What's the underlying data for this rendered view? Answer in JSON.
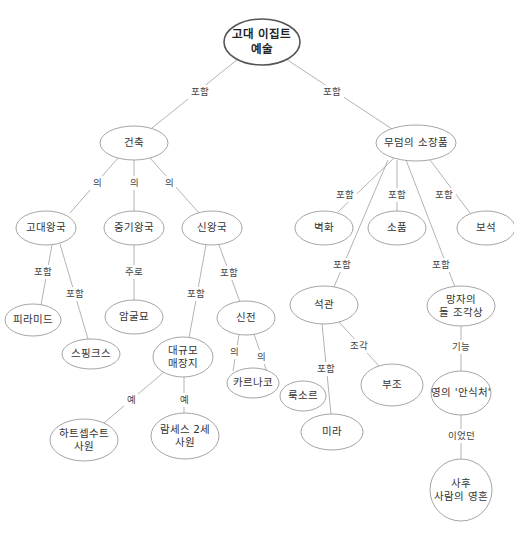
{
  "diagram": {
    "colors": {
      "node_stroke": "#9a9a9a",
      "root_stroke": "#555555",
      "edge": "#aaaaaa",
      "text": "#333333"
    },
    "nodes": [
      {
        "id": "root",
        "lines": [
          "고대 이집트",
          "예술"
        ],
        "x": 262,
        "y": 42,
        "rx": 38,
        "ry": 23,
        "root": true
      },
      {
        "id": "architecture",
        "lines": [
          "건축"
        ],
        "x": 134,
        "y": 143,
        "rx": 34,
        "ry": 17
      },
      {
        "id": "tomb-contents",
        "lines": [
          "무덤의 소장품"
        ],
        "x": 416,
        "y": 143,
        "rx": 40,
        "ry": 18
      },
      {
        "id": "old-kingdom",
        "lines": [
          "고대왕국"
        ],
        "x": 46,
        "y": 228,
        "rx": 30,
        "ry": 17
      },
      {
        "id": "middle-kingdom",
        "lines": [
          "중기왕국"
        ],
        "x": 134,
        "y": 228,
        "rx": 30,
        "ry": 17
      },
      {
        "id": "new-kingdom",
        "lines": [
          "신왕국"
        ],
        "x": 212,
        "y": 228,
        "rx": 30,
        "ry": 17
      },
      {
        "id": "mural",
        "lines": [
          "벽화"
        ],
        "x": 324,
        "y": 228,
        "rx": 29,
        "ry": 17
      },
      {
        "id": "accessories",
        "lines": [
          "소품"
        ],
        "x": 397,
        "y": 228,
        "rx": 29,
        "ry": 17
      },
      {
        "id": "jewelry",
        "lines": [
          "보석"
        ],
        "x": 486,
        "y": 228,
        "rx": 29,
        "ry": 17
      },
      {
        "id": "pyramid",
        "lines": [
          "피라미드"
        ],
        "x": 33,
        "y": 320,
        "rx": 28,
        "ry": 16
      },
      {
        "id": "rock-tomb",
        "lines": [
          "암굴묘"
        ],
        "x": 134,
        "y": 317,
        "rx": 29,
        "ry": 17
      },
      {
        "id": "sphinx",
        "lines": [
          "스핑크스"
        ],
        "x": 91,
        "y": 354,
        "rx": 29,
        "ry": 15
      },
      {
        "id": "temple",
        "lines": [
          "신전"
        ],
        "x": 246,
        "y": 318,
        "rx": 29,
        "ry": 17
      },
      {
        "id": "coffin",
        "lines": [
          "석관"
        ],
        "x": 324,
        "y": 305,
        "rx": 34,
        "ry": 19
      },
      {
        "id": "statue",
        "lines": [
          "망자의",
          "돌 조각상"
        ],
        "x": 461,
        "y": 306,
        "rx": 34,
        "ry": 20
      },
      {
        "id": "mortuary",
        "lines": [
          "대규모",
          "매장지"
        ],
        "x": 183,
        "y": 357,
        "rx": 30,
        "ry": 20
      },
      {
        "id": "karnak",
        "lines": [
          "카르나코"
        ],
        "x": 253,
        "y": 383,
        "rx": 26,
        "ry": 15
      },
      {
        "id": "luxor",
        "lines": [
          "룩소르"
        ],
        "x": 303,
        "y": 396,
        "rx": 23,
        "ry": 15
      },
      {
        "id": "relief",
        "lines": [
          "부조"
        ],
        "x": 392,
        "y": 385,
        "rx": 31,
        "ry": 21
      },
      {
        "id": "ka-dwelling",
        "lines": [
          "영의 '안식처'"
        ],
        "x": 461,
        "y": 393,
        "rx": 30,
        "ry": 22
      },
      {
        "id": "hatshepsut",
        "lines": [
          "하트셉수트",
          "사원"
        ],
        "x": 84,
        "y": 440,
        "rx": 34,
        "ry": 21
      },
      {
        "id": "ramesses",
        "lines": [
          "람세스 2세",
          "사원"
        ],
        "x": 185,
        "y": 436,
        "rx": 34,
        "ry": 23
      },
      {
        "id": "mummy",
        "lines": [
          "미라"
        ],
        "x": 332,
        "y": 432,
        "rx": 31,
        "ry": 18
      },
      {
        "id": "soul",
        "lines": [
          "사후",
          "사람의 영혼"
        ],
        "x": 461,
        "y": 490,
        "rx": 31,
        "ry": 31
      }
    ],
    "edges": [
      {
        "from": "root",
        "to": "architecture",
        "label": "포함",
        "lx": 200,
        "ly": 92,
        "x1": 238,
        "y1": 59,
        "x2": 152,
        "y2": 128
      },
      {
        "from": "root",
        "to": "tomb-contents",
        "label": "포함",
        "lx": 332,
        "ly": 92,
        "x1": 286,
        "y1": 59,
        "x2": 392,
        "y2": 129
      },
      {
        "from": "architecture",
        "to": "old-kingdom",
        "label": "의",
        "lx": 97,
        "ly": 183,
        "x1": 118,
        "y1": 158,
        "x2": 70,
        "y2": 213
      },
      {
        "from": "architecture",
        "to": "middle-kingdom",
        "label": "의",
        "lx": 134,
        "ly": 183,
        "x1": 134,
        "y1": 160,
        "x2": 134,
        "y2": 211
      },
      {
        "from": "architecture",
        "to": "new-kingdom",
        "label": "의",
        "lx": 169,
        "ly": 183,
        "x1": 150,
        "y1": 158,
        "x2": 199,
        "y2": 213
      },
      {
        "from": "old-kingdom",
        "to": "pyramid",
        "label": "포함",
        "lx": 43,
        "ly": 272,
        "x1": 52,
        "y1": 245,
        "x2": 41,
        "y2": 305
      },
      {
        "from": "old-kingdom",
        "to": "sphinx",
        "label": "포함",
        "lx": 75,
        "ly": 294,
        "x1": 60,
        "y1": 244,
        "x2": 88,
        "y2": 339
      },
      {
        "from": "middle-kingdom",
        "to": "rock-tomb",
        "label": "주로",
        "lx": 134,
        "ly": 272,
        "x1": 134,
        "y1": 245,
        "x2": 134,
        "y2": 300
      },
      {
        "from": "new-kingdom",
        "to": "mortuary",
        "label": "포함",
        "lx": 196,
        "ly": 294,
        "x1": 206,
        "y1": 245,
        "x2": 189,
        "y2": 338
      },
      {
        "from": "new-kingdom",
        "to": "temple",
        "label": "포함",
        "lx": 229,
        "ly": 273,
        "x1": 219,
        "y1": 245,
        "x2": 240,
        "y2": 302
      },
      {
        "from": "temple",
        "to": "karnak",
        "label": "의",
        "lx": 234,
        "ly": 352,
        "x1": 239,
        "y1": 335,
        "x2": 233,
        "y2": 371
      },
      {
        "from": "temple",
        "to": "luxor",
        "label": "의",
        "lx": 261,
        "ly": 357,
        "x1": 254,
        "y1": 334,
        "x2": 270,
        "y2": 381
      },
      {
        "from": "mortuary",
        "to": "hatshepsut",
        "label": "예",
        "lx": 131,
        "ly": 400,
        "x1": 164,
        "y1": 372,
        "x2": 104,
        "y2": 423
      },
      {
        "from": "mortuary",
        "to": "ramesses",
        "label": "예",
        "lx": 184,
        "ly": 400,
        "x1": 184,
        "y1": 377,
        "x2": 184,
        "y2": 413
      },
      {
        "from": "tomb-contents",
        "to": "mural",
        "label": "포함",
        "lx": 345,
        "ly": 195,
        "x1": 394,
        "y1": 158,
        "x2": 338,
        "y2": 212
      },
      {
        "from": "tomb-contents",
        "to": "accessories",
        "label": "포함",
        "lx": 397,
        "ly": 195,
        "x1": 397,
        "y1": 160,
        "x2": 397,
        "y2": 211
      },
      {
        "from": "tomb-contents",
        "to": "jewelry",
        "label": "포함",
        "lx": 444,
        "ly": 195,
        "x1": 430,
        "y1": 160,
        "x2": 470,
        "y2": 213
      },
      {
        "from": "tomb-contents",
        "to": "coffin",
        "label": "포함",
        "lx": 342,
        "ly": 265,
        "x1": 388,
        "y1": 160,
        "x2": 334,
        "y2": 287
      },
      {
        "from": "tomb-contents",
        "to": "statue",
        "label": "포함",
        "lx": 441,
        "ly": 265,
        "x1": 406,
        "y1": 160,
        "x2": 455,
        "y2": 287
      },
      {
        "from": "coffin",
        "to": "relief",
        "label": "조각",
        "lx": 359,
        "ly": 346,
        "x1": 339,
        "y1": 322,
        "x2": 379,
        "y2": 366
      },
      {
        "from": "coffin",
        "to": "mummy",
        "label": "포함",
        "lx": 326,
        "ly": 369,
        "x1": 322,
        "y1": 324,
        "x2": 331,
        "y2": 414
      },
      {
        "from": "statue",
        "to": "ka-dwelling",
        "label": "기능",
        "lx": 461,
        "ly": 347,
        "x1": 461,
        "y1": 326,
        "x2": 461,
        "y2": 371
      },
      {
        "from": "ka-dwelling",
        "to": "soul",
        "label": "이었던",
        "lx": 461,
        "ly": 436,
        "x1": 461,
        "y1": 415,
        "x2": 461,
        "y2": 459
      }
    ]
  }
}
